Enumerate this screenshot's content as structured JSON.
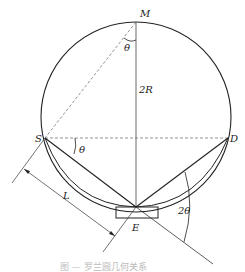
{
  "diagram": {
    "labels": {
      "M": "M",
      "S": "S",
      "D": "D",
      "E": "E",
      "theta_top": "θ",
      "theta_left": "θ",
      "two_R": "2R",
      "L": "L",
      "two_theta": "2θ"
    },
    "caption": "图 — 罗兰圆几何关系"
  }
}
